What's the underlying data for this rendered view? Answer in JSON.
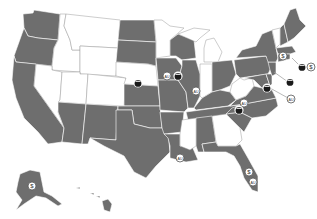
{
  "title": "",
  "map": {
    "shaded_color": "#6e6e6e",
    "unshaded_color": "#ffffff",
    "shaded_states": [
      "WA",
      "OR",
      "CA",
      "AZ",
      "NM",
      "TX",
      "OK",
      "KS",
      "ND",
      "SD",
      "IA",
      "MO",
      "AR",
      "LA",
      "WI",
      "IL",
      "KY",
      "TN",
      "AL",
      "FL",
      "SC",
      "NC",
      "VA",
      "OH",
      "PA",
      "NY",
      "ME",
      "NH",
      "MA",
      "CT",
      "RI",
      "NJ",
      "DE",
      "MD",
      "AK",
      "HI"
    ],
    "unshaded_states": [
      "MT",
      "ID",
      "WY",
      "NV",
      "UT",
      "CO",
      "NE",
      "MN",
      "MI",
      "IN",
      "WV",
      "MS",
      "GA",
      "VT"
    ],
    "markers": [
      {
        "type": "pot-icon",
        "state": "NE",
        "x": 138,
        "y": 83
      },
      {
        "type": "label-icon",
        "text": "AU",
        "state": "IA",
        "x": 167,
        "y": 76
      },
      {
        "type": "pot-icon",
        "state": "IA",
        "x": 178,
        "y": 76
      },
      {
        "type": "label-icon",
        "text": "AU",
        "state": "IL",
        "x": 196,
        "y": 91
      },
      {
        "type": "label-icon",
        "text": "AU",
        "state": "WV",
        "x": 244,
        "y": 103
      },
      {
        "type": "pot-icon",
        "state": "WV",
        "x": 239,
        "y": 110
      },
      {
        "type": "pot-icon",
        "state": "MD",
        "x": 267,
        "y": 88
      },
      {
        "type": "pot-icon",
        "state": "NJ",
        "x": 290,
        "y": 82
      },
      {
        "type": "label-icon",
        "text": "AU",
        "state": "DE",
        "x": 291,
        "y": 99
      },
      {
        "type": "dollar-icon",
        "text": "$",
        "state": "MA",
        "x": 283,
        "y": 56
      },
      {
        "type": "pot-icon",
        "state": "RI",
        "x": 302,
        "y": 67
      },
      {
        "type": "dollar-icon",
        "text": "$",
        "state": "RI",
        "x": 311,
        "y": 67
      },
      {
        "type": "label-icon",
        "text": "AU",
        "state": "LA",
        "x": 180,
        "y": 158
      },
      {
        "type": "dollar-icon",
        "text": "$",
        "state": "FL",
        "x": 249,
        "y": 172
      },
      {
        "type": "label-icon",
        "text": "AU",
        "state": "FL",
        "x": 253,
        "y": 182
      },
      {
        "type": "dollar-icon",
        "text": "$",
        "state": "AK",
        "x": 32,
        "y": 186
      }
    ]
  }
}
